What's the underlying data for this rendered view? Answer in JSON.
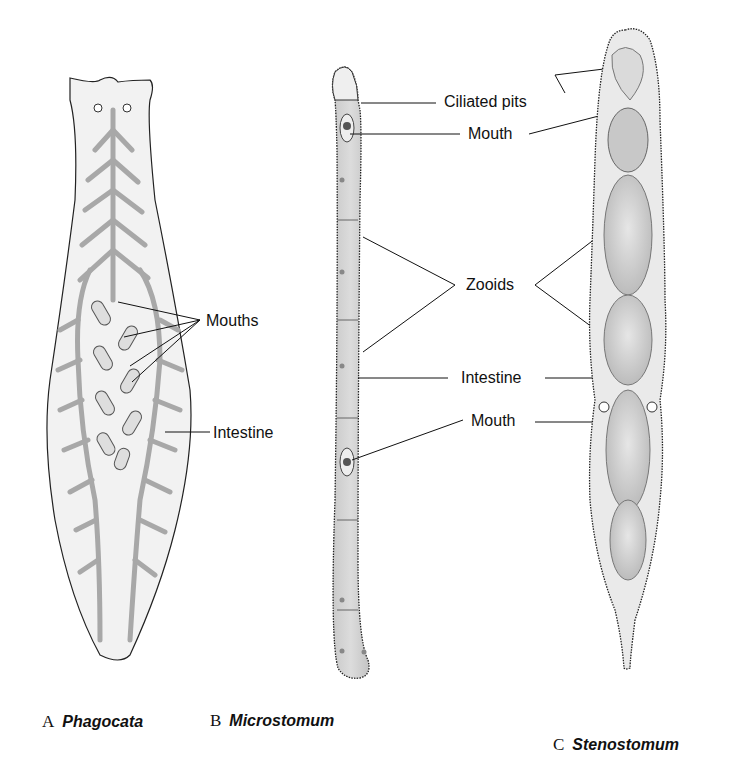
{
  "figure": {
    "panels": [
      {
        "letter": "A",
        "name": "Phagocata",
        "labels": {
          "mouths": "Mouths",
          "intestine": "Intestine"
        }
      },
      {
        "letter": "B",
        "name": "Microstomum",
        "labels": {
          "ciliated_pits": "Ciliated pits",
          "mouth_top": "Mouth",
          "zooids": "Zooids",
          "intestine": "Intestine",
          "mouth_bottom": "Mouth"
        }
      },
      {
        "letter": "C",
        "name": "Stenostomum"
      }
    ]
  },
  "colors": {
    "body_fill": "#f1f1f1",
    "gut_gray": "#a8a8a8",
    "outline": "#222222",
    "zooid_fill": "#d4d4d4"
  }
}
